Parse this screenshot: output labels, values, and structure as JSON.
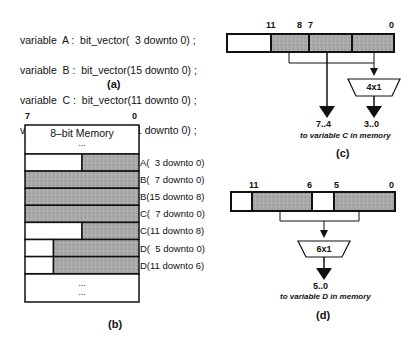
{
  "declarations": [
    "variable  A :  bit_vector(  3 downto 0) ;",
    "variable  B :  bit_vector(15 downto 0) ;",
    "variable  C :  bit_vector(11 downto 0) ;",
    "variable  D :  bit_vector(11 downto 0) ;"
  ],
  "captions": {
    "a": "(a)",
    "b": "(b)",
    "c": "(c)",
    "d": "(d)"
  },
  "memory": {
    "msb": "7",
    "lsb": "0",
    "title": "8–bit  Memory",
    "top_ellipsis": "...",
    "bottom_ellipsis": [
      "...",
      "..."
    ],
    "rows": [
      {
        "label": "A(  3 downto 0)",
        "used_fraction": 0.5
      },
      {
        "label": "B(  7 downto 0)",
        "used_fraction": 1.0
      },
      {
        "label": "B(15 downto 8)",
        "used_fraction": 1.0
      },
      {
        "label": "C(  7 downto 0)",
        "used_fraction": 1.0
      },
      {
        "label": "C(11 downto 8)",
        "used_fraction": 0.5
      },
      {
        "label": "D(  5 downto 0)",
        "used_fraction": 0.75
      },
      {
        "label": "D(11 downto 6)",
        "used_fraction": 0.75
      }
    ]
  },
  "panel_c": {
    "bit_labels": [
      "11",
      "8",
      "7",
      "0"
    ],
    "mux": "4x1",
    "out_left": "7..4",
    "out_right": "3..0",
    "note": "to  variable C in memory"
  },
  "panel_d": {
    "bit_labels": [
      "11",
      "6",
      "5",
      "0"
    ],
    "mux": "6x1",
    "out": "5..0",
    "note": "to  variable D in memory"
  },
  "colors": {
    "shade": "#a8a8a8",
    "line": "#111111"
  }
}
